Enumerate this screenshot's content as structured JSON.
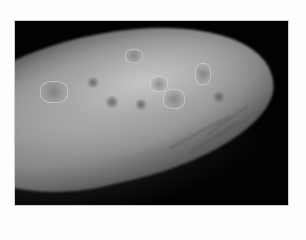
{
  "image": {
    "subject": "clinical photograph of a finger with skin lesions",
    "color_mode": "grayscale",
    "background_color": "#020202",
    "border_color": "#fdfdfd"
  }
}
